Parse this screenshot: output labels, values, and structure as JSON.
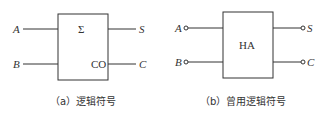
{
  "diagram_a": {
    "inputs": [
      "A",
      "B"
    ],
    "outputs": [
      "S",
      "C"
    ],
    "sum_symbol": "Σ",
    "carry_label": "CO",
    "caption": "（a）逻辑符号"
  },
  "diagram_b": {
    "inputs": [
      "A",
      "B"
    ],
    "outputs": [
      "S",
      "C"
    ],
    "block_label": "HA",
    "caption": "（b）曾用逻辑符号"
  },
  "colors": {
    "stroke": "#333333",
    "background": "#ffffff"
  }
}
